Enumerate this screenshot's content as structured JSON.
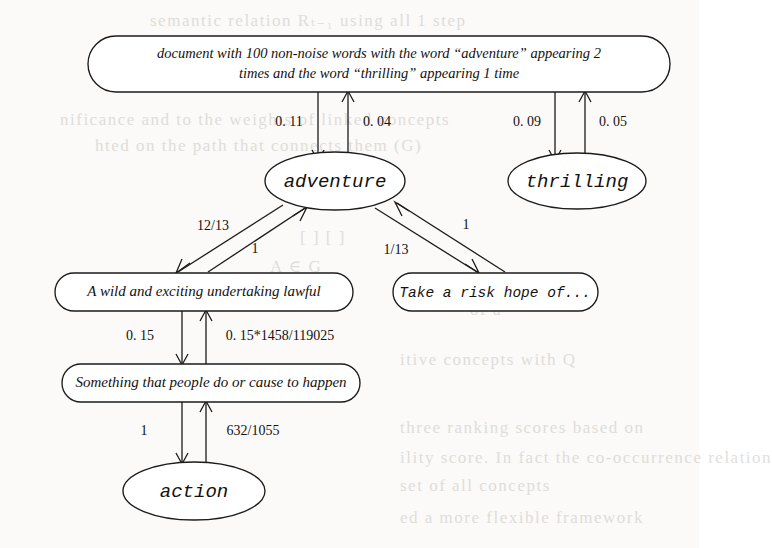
{
  "diagram": {
    "type": "directed-graph",
    "nodes": [
      {
        "id": "document",
        "shape": "rounded-rect",
        "role": "document-node",
        "lines": [
          "document with 100 non-noise words with the word  “adventure”  appearing 2",
          "times and the word  “thrilling”  appearing 1 time"
        ]
      },
      {
        "id": "adventure",
        "shape": "ellipse",
        "role": "word-node",
        "label": "adventure"
      },
      {
        "id": "thrilling",
        "shape": "ellipse",
        "role": "word-node",
        "label": "thrilling"
      },
      {
        "id": "gloss-adventure-1",
        "shape": "rounded-rect",
        "role": "gloss-node",
        "label": "A wild and exciting undertaking lawful"
      },
      {
        "id": "gloss-adventure-2",
        "shape": "rounded-rect",
        "role": "gloss-node",
        "label": "Take a risk hope of..."
      },
      {
        "id": "gloss-action",
        "shape": "rounded-rect",
        "role": "gloss-node",
        "label": "Something that people do or cause to happen"
      },
      {
        "id": "action",
        "shape": "ellipse",
        "role": "word-node",
        "label": "action"
      }
    ],
    "edges": [
      {
        "id": "e1",
        "from": "document",
        "to": "adventure",
        "weight": "0. 11",
        "direction": "down"
      },
      {
        "id": "e2",
        "from": "adventure",
        "to": "document",
        "weight": "0. 04",
        "direction": "up"
      },
      {
        "id": "e3",
        "from": "document",
        "to": "thrilling",
        "weight": "0. 09",
        "direction": "down"
      },
      {
        "id": "e4",
        "from": "thrilling",
        "to": "document",
        "weight": "0. 05",
        "direction": "up"
      },
      {
        "id": "e5",
        "from": "adventure",
        "to": "gloss-adventure-1",
        "weight": "12/13",
        "direction": "down-left"
      },
      {
        "id": "e6",
        "from": "gloss-adventure-1",
        "to": "adventure",
        "weight": "1",
        "direction": "up-right"
      },
      {
        "id": "e7",
        "from": "adventure",
        "to": "gloss-adventure-2",
        "weight": "1/13",
        "direction": "down-right"
      },
      {
        "id": "e8",
        "from": "gloss-adventure-2",
        "to": "adventure",
        "weight": "1",
        "direction": "up-left"
      },
      {
        "id": "e9",
        "from": "gloss-adventure-1",
        "to": "gloss-action",
        "weight": "0. 15",
        "direction": "down"
      },
      {
        "id": "e10",
        "from": "gloss-action",
        "to": "gloss-adventure-1",
        "weight": "0. 15*1458/119025",
        "direction": "up"
      },
      {
        "id": "e11",
        "from": "gloss-action",
        "to": "action",
        "weight": "1",
        "direction": "down"
      },
      {
        "id": "e12",
        "from": "action",
        "to": "gloss-action",
        "weight": "632/1055",
        "direction": "up"
      }
    ]
  },
  "background_bleed": {
    "note": "faint reverse-side print visible through the paper",
    "fragments": [
      {
        "text": "semantic relation Rₜ₋₁ using all 1 step",
        "x": 150,
        "y": 10
      },
      {
        "text": "nificance and to the weights of linked concepts",
        "x": 60,
        "y": 110
      },
      {
        "text": "hted on the path that connects them (G)",
        "x": 95,
        "y": 136
      },
      {
        "text": "[ ] [ ]",
        "x": 300,
        "y": 228
      },
      {
        "text": "A  ∈  G",
        "x": 270,
        "y": 256
      },
      {
        "text": "of a",
        "x": 470,
        "y": 300
      },
      {
        "text": "itive  concepts  with  Q",
        "x": 400,
        "y": 350
      },
      {
        "text": "three  ranking  scores  based  on",
        "x": 400,
        "y": 418
      },
      {
        "text": "ility  score.  In  fact  the  co-occurrence  relation",
        "x": 400,
        "y": 448
      },
      {
        "text": "set  of  all  concepts",
        "x": 400,
        "y": 476
      },
      {
        "text": "ed  a  more  flexible  framework",
        "x": 400,
        "y": 508
      }
    ]
  }
}
